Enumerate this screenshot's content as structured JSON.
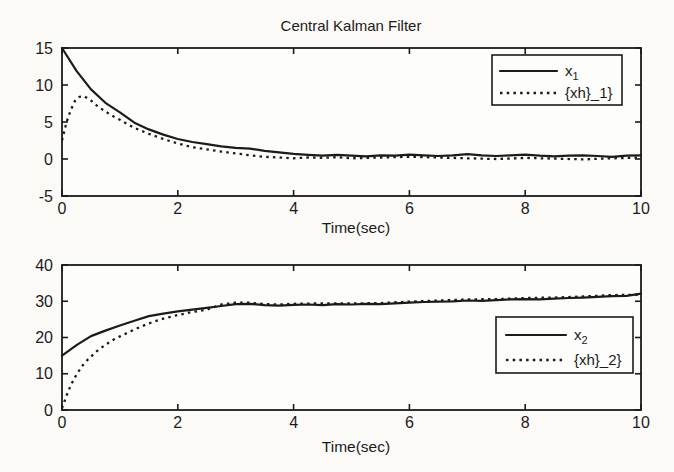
{
  "figure": {
    "title": "Central Kalman Filter",
    "colors": {
      "line": "#1b1b1b",
      "text": "#1c1c1c",
      "background": "#fbfaf7",
      "plot_background": "#fdfdfb"
    }
  },
  "chart_data": [
    {
      "type": "line",
      "title": "Central Kalman Filter",
      "xlabel": "Time(sec)",
      "ylabel": "",
      "xlim": [
        0,
        10
      ],
      "ylim": [
        -5,
        15
      ],
      "xticks": [
        0,
        2,
        4,
        6,
        8,
        10
      ],
      "yticks": [
        -5,
        0,
        5,
        10,
        15
      ],
      "grid": false,
      "legend_position": "upper right",
      "legend": [
        {
          "main": "x",
          "sub": "1",
          "style": "solid"
        },
        {
          "label": "{xh}_1}",
          "style": "dotted"
        }
      ],
      "series": [
        {
          "name": "x_1",
          "style": "solid",
          "x0": 0,
          "dx": 0.25,
          "y": [
            15.0,
            11.9,
            9.4,
            7.6,
            6.3,
            4.9,
            4.0,
            3.3,
            2.7,
            2.3,
            2.0,
            1.7,
            1.5,
            1.4,
            1.1,
            0.9,
            0.7,
            0.55,
            0.45,
            0.55,
            0.45,
            0.35,
            0.5,
            0.45,
            0.6,
            0.5,
            0.4,
            0.5,
            0.65,
            0.5,
            0.4,
            0.5,
            0.6,
            0.45,
            0.35,
            0.45,
            0.5,
            0.4,
            0.3,
            0.45,
            0.5
          ]
        },
        {
          "name": "{xh}_1",
          "style": "dotted",
          "x": [
            0,
            0.08,
            0.15,
            0.22,
            0.3,
            0.38,
            0.5,
            0.62,
            0.75,
            0.9,
            1.0,
            1.25,
            1.5,
            1.75,
            2.0,
            2.25,
            2.5,
            2.75,
            3.0,
            3.25,
            3.5,
            3.75,
            4.0,
            4.25,
            4.5,
            4.75,
            5.0,
            5.5,
            6.0,
            6.5,
            7.0,
            7.5,
            8.0,
            8.5,
            9.0,
            9.5,
            10.0
          ],
          "y": [
            2.5,
            5.0,
            6.6,
            7.8,
            8.4,
            8.5,
            7.9,
            7.1,
            6.4,
            5.7,
            5.3,
            4.2,
            3.4,
            2.7,
            2.1,
            1.6,
            1.3,
            1.0,
            0.75,
            0.5,
            0.3,
            0.2,
            0.1,
            0.2,
            0.15,
            0.25,
            0.1,
            0.2,
            0.3,
            0.2,
            0.1,
            0.0,
            0.15,
            0.05,
            -0.05,
            0.1,
            0.2
          ]
        }
      ]
    },
    {
      "type": "line",
      "title": "",
      "xlabel": "Time(sec)",
      "ylabel": "",
      "xlim": [
        0,
        10
      ],
      "ylim": [
        0,
        40
      ],
      "xticks": [
        0,
        2,
        4,
        6,
        8,
        10
      ],
      "yticks": [
        0,
        10,
        20,
        30,
        40
      ],
      "grid": false,
      "legend_position": "right",
      "legend": [
        {
          "main": "x",
          "sub": "2",
          "style": "solid"
        },
        {
          "label": "{xh}_2}",
          "style": "dotted"
        }
      ],
      "series": [
        {
          "name": "x_2",
          "style": "solid",
          "x0": 0,
          "dx": 0.25,
          "y": [
            15.0,
            17.9,
            20.4,
            21.9,
            23.3,
            24.6,
            25.9,
            26.6,
            27.2,
            27.7,
            28.2,
            28.7,
            29.2,
            29.3,
            28.9,
            28.8,
            29.0,
            29.1,
            28.9,
            29.2,
            29.1,
            29.3,
            29.2,
            29.4,
            29.6,
            29.8,
            29.9,
            30.0,
            30.2,
            30.1,
            30.3,
            30.5,
            30.6,
            30.5,
            30.7,
            30.9,
            31.0,
            31.2,
            31.4,
            31.5,
            32.1
          ]
        },
        {
          "name": "{xh}_2",
          "style": "dotted",
          "x": [
            0,
            0.08,
            0.15,
            0.25,
            0.35,
            0.45,
            0.6,
            0.75,
            0.9,
            1.0,
            1.25,
            1.5,
            1.75,
            2.0,
            2.25,
            2.5,
            2.75,
            3.0,
            3.25,
            3.5,
            3.75,
            4.0,
            4.5,
            5.0,
            5.5,
            6.0,
            6.5,
            7.0,
            7.5,
            8.0,
            8.5,
            9.0,
            9.5,
            10.0
          ],
          "y": [
            0.5,
            4.0,
            6.8,
            9.8,
            12.2,
            14.0,
            16.2,
            18.0,
            19.5,
            20.3,
            22.2,
            23.9,
            25.2,
            26.2,
            27.0,
            27.7,
            29.1,
            29.6,
            29.6,
            29.2,
            29.1,
            29.3,
            29.4,
            29.4,
            29.5,
            29.9,
            30.2,
            30.5,
            30.6,
            30.9,
            31.0,
            31.3,
            31.7,
            31.8
          ]
        }
      ]
    }
  ]
}
